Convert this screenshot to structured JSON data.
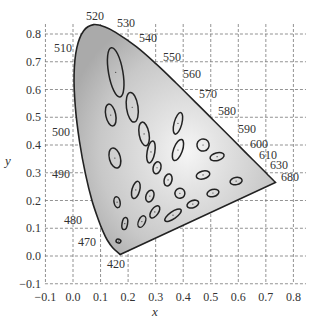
{
  "chart_data": {
    "type": "scatter",
    "title": "",
    "subtitle": "CIE 1931 chromaticity diagram with MacAdam ellipses",
    "xlabel": "x",
    "ylabel": "y",
    "xlim": [
      -0.1,
      0.8
    ],
    "ylim": [
      -0.1,
      0.8
    ],
    "grid": true,
    "legend": null,
    "x_ticks": [
      "−0.1",
      "0.0",
      "0.1",
      "0.2",
      "0.3",
      "0.4",
      "0.5",
      "0.6",
      "0.7",
      "0.8"
    ],
    "y_ticks": [
      "−0.1",
      "0.0",
      "0.1",
      "0.2",
      "0.3",
      "0.4",
      "0.5",
      "0.6",
      "0.7",
      "0.8"
    ],
    "spectral_locus_labels_nm": [
      "420",
      "470",
      "480",
      "490",
      "500",
      "510",
      "520",
      "530",
      "540",
      "550",
      "560",
      "570",
      "580",
      "590",
      "600",
      "610",
      "630",
      "680"
    ],
    "spectral_locus": [
      {
        "nm": 420,
        "x": 0.1714,
        "y": 0.0051
      },
      {
        "nm": 460,
        "x": 0.144,
        "y": 0.0297
      },
      {
        "nm": 470,
        "x": 0.1241,
        "y": 0.0578
      },
      {
        "nm": 475,
        "x": 0.1096,
        "y": 0.0868
      },
      {
        "nm": 480,
        "x": 0.0913,
        "y": 0.1327
      },
      {
        "nm": 485,
        "x": 0.0687,
        "y": 0.2007
      },
      {
        "nm": 490,
        "x": 0.0454,
        "y": 0.295
      },
      {
        "nm": 495,
        "x": 0.0235,
        "y": 0.4127
      },
      {
        "nm": 500,
        "x": 0.0082,
        "y": 0.5384
      },
      {
        "nm": 505,
        "x": 0.0039,
        "y": 0.6548
      },
      {
        "nm": 510,
        "x": 0.0139,
        "y": 0.7502
      },
      {
        "nm": 515,
        "x": 0.0389,
        "y": 0.812
      },
      {
        "nm": 520,
        "x": 0.0743,
        "y": 0.8338
      },
      {
        "nm": 525,
        "x": 0.1142,
        "y": 0.8262
      },
      {
        "nm": 530,
        "x": 0.1547,
        "y": 0.8059
      },
      {
        "nm": 540,
        "x": 0.2296,
        "y": 0.7543
      },
      {
        "nm": 550,
        "x": 0.3016,
        "y": 0.6923
      },
      {
        "nm": 560,
        "x": 0.3731,
        "y": 0.6245
      },
      {
        "nm": 570,
        "x": 0.4441,
        "y": 0.5547
      },
      {
        "nm": 580,
        "x": 0.5125,
        "y": 0.4866
      },
      {
        "nm": 590,
        "x": 0.5752,
        "y": 0.4242
      },
      {
        "nm": 600,
        "x": 0.627,
        "y": 0.3725
      },
      {
        "nm": 610,
        "x": 0.6658,
        "y": 0.334
      },
      {
        "nm": 630,
        "x": 0.7079,
        "y": 0.292
      },
      {
        "nm": 680,
        "x": 0.7347,
        "y": 0.2653
      }
    ],
    "ellipses": [
      {
        "x": 0.155,
        "y": 0.662,
        "rx": 0.026,
        "ry": 0.09,
        "angle": -10
      },
      {
        "x": 0.137,
        "y": 0.508,
        "rx": 0.018,
        "ry": 0.04,
        "angle": -12
      },
      {
        "x": 0.215,
        "y": 0.536,
        "rx": 0.021,
        "ry": 0.054,
        "angle": -8
      },
      {
        "x": 0.258,
        "y": 0.44,
        "rx": 0.018,
        "ry": 0.043,
        "angle": -10
      },
      {
        "x": 0.152,
        "y": 0.353,
        "rx": 0.02,
        "ry": 0.037,
        "angle": -15
      },
      {
        "x": 0.283,
        "y": 0.375,
        "rx": 0.014,
        "ry": 0.04,
        "angle": 10
      },
      {
        "x": 0.381,
        "y": 0.478,
        "rx": 0.014,
        "ry": 0.04,
        "angle": 15
      },
      {
        "x": 0.381,
        "y": 0.382,
        "rx": 0.016,
        "ry": 0.04,
        "angle": 20
      },
      {
        "x": 0.472,
        "y": 0.4,
        "rx": 0.022,
        "ry": 0.022,
        "angle": 30
      },
      {
        "x": 0.305,
        "y": 0.318,
        "rx": 0.014,
        "ry": 0.022,
        "angle": 15
      },
      {
        "x": 0.345,
        "y": 0.274,
        "rx": 0.014,
        "ry": 0.022,
        "angle": 15
      },
      {
        "x": 0.523,
        "y": 0.358,
        "rx": 0.026,
        "ry": 0.014,
        "angle": -15
      },
      {
        "x": 0.472,
        "y": 0.292,
        "rx": 0.025,
        "ry": 0.014,
        "angle": -15
      },
      {
        "x": 0.592,
        "y": 0.27,
        "rx": 0.022,
        "ry": 0.013,
        "angle": -10
      },
      {
        "x": 0.228,
        "y": 0.238,
        "rx": 0.014,
        "ry": 0.032,
        "angle": 15
      },
      {
        "x": 0.279,
        "y": 0.216,
        "rx": 0.014,
        "ry": 0.022,
        "angle": 20
      },
      {
        "x": 0.388,
        "y": 0.226,
        "rx": 0.018,
        "ry": 0.018,
        "angle": 30
      },
      {
        "x": 0.508,
        "y": 0.227,
        "rx": 0.022,
        "ry": 0.013,
        "angle": -15
      },
      {
        "x": 0.16,
        "y": 0.194,
        "rx": 0.011,
        "ry": 0.02,
        "angle": -10
      },
      {
        "x": 0.435,
        "y": 0.187,
        "rx": 0.022,
        "ry": 0.013,
        "angle": -20
      },
      {
        "x": 0.297,
        "y": 0.159,
        "rx": 0.013,
        "ry": 0.025,
        "angle": 35
      },
      {
        "x": 0.363,
        "y": 0.147,
        "rx": 0.013,
        "ry": 0.035,
        "angle": 55
      },
      {
        "x": 0.25,
        "y": 0.124,
        "rx": 0.012,
        "ry": 0.022,
        "angle": 25
      },
      {
        "x": 0.188,
        "y": 0.117,
        "rx": 0.01,
        "ry": 0.022,
        "angle": 10
      },
      {
        "x": 0.165,
        "y": 0.054,
        "rx": 0.009,
        "ry": 0.007,
        "angle": 20
      }
    ]
  },
  "axes": {
    "xlabel": "x",
    "ylabel": "y"
  }
}
